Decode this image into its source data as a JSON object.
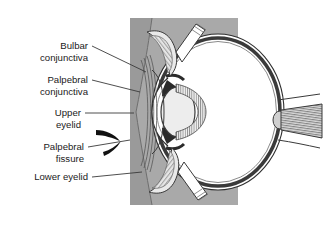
{
  "figure": {
    "name": "eye-sagittal-cross-section",
    "background_color": "#ffffff",
    "panel_color": "#a9a9a9",
    "outline_color": "#3a3a3a",
    "dark_fill": "#2b2b2b",
    "light_fill": "#ededed",
    "leader_color": "#3a3a3a"
  },
  "labels": [
    {
      "id": "bulbar-conjunctiva",
      "line1": "Bulbar",
      "line2": "conjunctiva"
    },
    {
      "id": "palpebral-conjunctiva",
      "line1": "Palpebral",
      "line2": "conjunctiva"
    },
    {
      "id": "upper-eyelid",
      "line1": "Upper",
      "line2": "eyelid"
    },
    {
      "id": "palpebral-fissure",
      "line1": "Palpebral",
      "line2": "fissure"
    },
    {
      "id": "lower-eyelid",
      "line1": "Lower eyelid",
      "line2": ""
    }
  ]
}
